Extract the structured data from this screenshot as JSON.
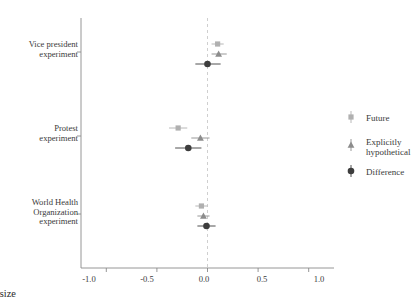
{
  "chart_data": {
    "type": "scatter",
    "subtype": "forest-plot",
    "title": "",
    "xlabel": "Effect size",
    "ylabel": "",
    "xlim": [
      -1.25,
      1.25
    ],
    "xticks": [
      -1.0,
      -0.5,
      0.0,
      0.5,
      1.0
    ],
    "xticklabels": [
      "-1.0",
      "-0.5",
      "0.0",
      "0.5",
      "1.0"
    ],
    "grid": false,
    "reference_line": {
      "x": 0.0,
      "style": "dashed",
      "color": "#c9c9c9"
    },
    "legend": {
      "position": "right"
    },
    "categories": [
      "Vice president experiment",
      "Protest experiment",
      "World Health Organization experiment"
    ],
    "series": [
      {
        "name": "Future",
        "marker": "square",
        "color": "#b0b0b0",
        "values": [
          0.1,
          -0.29,
          -0.06
        ],
        "ci_low": [
          0.04,
          -0.38,
          -0.12
        ],
        "ci_high": [
          0.16,
          -0.2,
          0.0
        ]
      },
      {
        "name": "Explicitly hypothetical",
        "marker": "triangle",
        "color": "#8c8c8c",
        "values": [
          0.11,
          -0.07,
          -0.04
        ],
        "ci_low": [
          0.04,
          -0.16,
          -0.1
        ],
        "ci_high": [
          0.19,
          0.02,
          0.02
        ]
      },
      {
        "name": "Difference",
        "marker": "circle",
        "color": "#3d3d3d",
        "values": [
          0.0,
          -0.19,
          -0.01
        ],
        "ci_low": [
          -0.12,
          -0.32,
          -0.1
        ],
        "ci_high": [
          0.13,
          -0.06,
          0.08
        ]
      }
    ]
  },
  "axis": {
    "x_title": "Effect size",
    "tick_labels": [
      "-1.0",
      "-0.5",
      "0.0",
      "0.5",
      "1.0"
    ]
  },
  "y_categories": [
    {
      "lines": [
        "Vice president",
        "experiment"
      ]
    },
    {
      "lines": [
        "Protest",
        "experiment"
      ]
    },
    {
      "lines": [
        "World Health",
        "Organization",
        "experiment"
      ]
    }
  ],
  "legend": {
    "entries": [
      {
        "label_lines": [
          "Future"
        ],
        "marker": "square-marker",
        "color": "#b0b0b0"
      },
      {
        "label_lines": [
          "Explicitly",
          "hypothetical"
        ],
        "marker": "triangle-marker",
        "color": "#8c8c8c"
      },
      {
        "label_lines": [
          "Difference"
        ],
        "marker": "circle-marker",
        "color": "#3d3d3d"
      }
    ]
  },
  "colors": {
    "future": "#b0b0b0",
    "hypothetical": "#8c8c8c",
    "difference": "#3d3d3d",
    "axis": "#8a8a8a",
    "reference": "#cccccc",
    "background": "#ffffff"
  }
}
